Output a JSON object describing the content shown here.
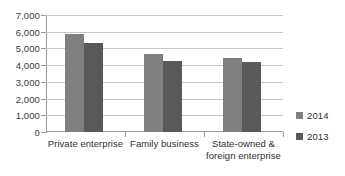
{
  "chart_data": {
    "type": "bar",
    "title": "",
    "subtitle": "",
    "xlabel": "",
    "ylabel": "",
    "categories": [
      "Private enterprise",
      "Family business",
      "State-owned & foreign enterprise"
    ],
    "category_lines": [
      [
        "Private enterprise"
      ],
      [
        "Family business"
      ],
      [
        "State-owned &",
        "foreign enterprise"
      ]
    ],
    "series": [
      {
        "name": "2014",
        "color": "#808080",
        "values": [
          5850,
          4650,
          4450
        ]
      },
      {
        "name": "2013",
        "color": "#595959",
        "values": [
          5350,
          4250,
          4200
        ]
      }
    ],
    "ylim": [
      0,
      7000
    ],
    "ytick_step": 1000,
    "ytick_labels": [
      "7,000",
      "6,000",
      "5,000",
      "4,000",
      "3,000",
      "2,000",
      "1,000",
      "0"
    ],
    "ytick_values": [
      7000,
      6000,
      5000,
      4000,
      3000,
      2000,
      1000,
      0
    ],
    "grid": true,
    "grid_color": "#c8c8c8",
    "axis_color": "#9a9a9a",
    "legend_position": "right",
    "background": "#ffffff"
  },
  "legend": {
    "items": [
      {
        "label": "2014",
        "color": "#808080"
      },
      {
        "label": "2013",
        "color": "#595959"
      }
    ]
  }
}
